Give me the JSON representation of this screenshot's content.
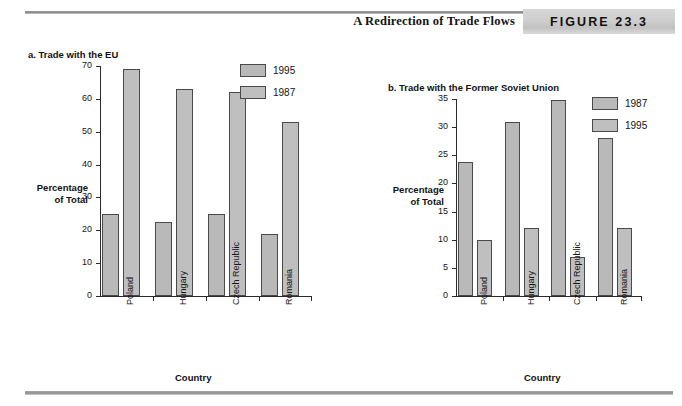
{
  "header": {
    "title": "A Redirection of Trade Flows",
    "figure_label": "FIGURE 23.3"
  },
  "chart_data": [
    {
      "type": "bar",
      "panel_id": "a",
      "title": "a. Trade with the EU",
      "categories": [
        "Poland",
        "Hungary",
        "Czech Republic",
        "Romania"
      ],
      "series": [
        {
          "name": "1995",
          "values": [
            25,
            22.5,
            25,
            19
          ]
        },
        {
          "name": "1987",
          "values": [
            69,
            63,
            62,
            53
          ]
        }
      ],
      "xlabel": "Country",
      "ylabel": "Percentage of Total",
      "ylim": [
        0,
        70
      ],
      "ytick_step": 10,
      "yticks": [
        0,
        10,
        20,
        30,
        40,
        50,
        60,
        70
      ],
      "grid": false,
      "legend_position": "top-right",
      "legend_order": [
        "1995",
        "1987"
      ]
    },
    {
      "type": "bar",
      "panel_id": "b",
      "title": "b. Trade with the Former Soviet Union",
      "categories": [
        "Poland",
        "Hungary",
        "Czech Republic",
        "Romania"
      ],
      "series": [
        {
          "name": "1987",
          "values": [
            23.8,
            31,
            34.8,
            28
          ]
        },
        {
          "name": "1995",
          "values": [
            10,
            12,
            7,
            12
          ]
        }
      ],
      "xlabel": "Country",
      "ylabel": "Percentage of Total",
      "ylim": [
        0,
        35
      ],
      "ytick_step": 5,
      "yticks": [
        0,
        5,
        10,
        15,
        20,
        25,
        30,
        35
      ],
      "grid": false,
      "legend_position": "top-right",
      "legend_order": [
        "1987",
        "1995"
      ]
    }
  ],
  "labels": {
    "ylabel_line1": "Percentage",
    "ylabel_line2": "of Total",
    "xlabel": "Country"
  },
  "colors": {
    "series_a_fill": "#b9b9b9",
    "series_b_fill": "#bfbfbf",
    "bar_border": "#4a4a4a",
    "axis": "#2b2b2b",
    "badge_bg": "#cfcfcf",
    "rule": "#909090"
  }
}
